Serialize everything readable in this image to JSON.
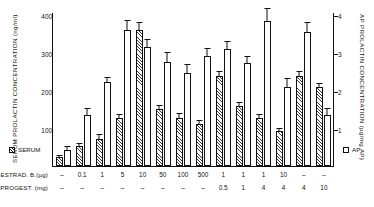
{
  "axes": {
    "left_title": "SERUM PROLACTIN CONCENTRATION  (ng/ml)",
    "right_title": "AP PROLACTIN CONCENTRATION  (µg/mg AP)",
    "left_ticks": [
      "400",
      "300",
      "200",
      "100"
    ],
    "right_ticks": [
      "4",
      "3",
      "2",
      "1"
    ]
  },
  "legend": {
    "serum_label": "SERUM",
    "serum_swatch": "hatched-square",
    "ap_label": "AP",
    "ap_swatch": "open-square"
  },
  "rows": {
    "estradiol_label": "ESTRAD. B.(µg)",
    "progest_label": "PROGEST. (mg)",
    "estradiol": [
      "–",
      "0.1",
      "1",
      "5",
      "10",
      "50",
      "100",
      "500",
      "1",
      "1",
      "1",
      "10",
      "–",
      "–"
    ],
    "progest": [
      "–",
      "–",
      "–",
      "–",
      "–",
      "–",
      "–",
      "–",
      "0.5",
      "1",
      "4",
      "4",
      "4",
      "10"
    ]
  },
  "chart_data": {
    "type": "bar",
    "title": "",
    "xlabel": "",
    "ylabel": "SERUM PROLACTIN CONCENTRATION  (ng/ml)",
    "y2label": "AP PROLACTIN CONCENTRATION  (µg/mg AP)",
    "ylim": [
      0,
      420
    ],
    "y2lim": [
      0,
      4.2
    ],
    "grid": false,
    "legend_position": "bottom-outside",
    "categories": [
      "ESTRAD – / PROG –",
      "ESTRAD 0.1 / PROG –",
      "ESTRAD 1 / PROG –",
      "ESTRAD 5 / PROG –",
      "ESTRAD 10 / PROG –",
      "ESTRAD 50 / PROG –",
      "ESTRAD 100 / PROG –",
      "ESTRAD 500 / PROG –",
      "ESTRAD 1 / PROG 0.5",
      "ESTRAD 1 / PROG 1",
      "ESTRAD 1 / PROG 4",
      "ESTRAD 10 / PROG 4",
      "ESTRAD – / PROG 4",
      "ESTRAD – / PROG 10"
    ],
    "series": [
      {
        "name": "SERUM",
        "unit": "ng/ml",
        "axis": "left",
        "pattern": "hatched",
        "values": [
          25,
          55,
          75,
          130,
          370,
          155,
          130,
          115,
          245,
          165,
          130,
          95,
          245,
          215
        ],
        "errors": [
          8,
          10,
          14,
          15,
          25,
          14,
          16,
          14,
          16,
          12,
          14,
          12,
          16,
          14
        ]
      },
      {
        "name": "AP",
        "unit": "µg/mg AP",
        "axis": "right",
        "pattern": "open",
        "values_ng_equiv": [
          45,
          140,
          230,
          370,
          325,
          285,
          255,
          300,
          320,
          280,
          395,
          215,
          365,
          140
        ],
        "values": [
          0.45,
          1.4,
          2.3,
          3.7,
          3.25,
          2.85,
          2.55,
          3.0,
          3.2,
          2.8,
          3.95,
          2.15,
          3.65,
          1.4
        ],
        "errors_ng_equiv": [
          12,
          20,
          16,
          30,
          24,
          28,
          26,
          24,
          24,
          22,
          38,
          28,
          30,
          22
        ]
      }
    ]
  }
}
